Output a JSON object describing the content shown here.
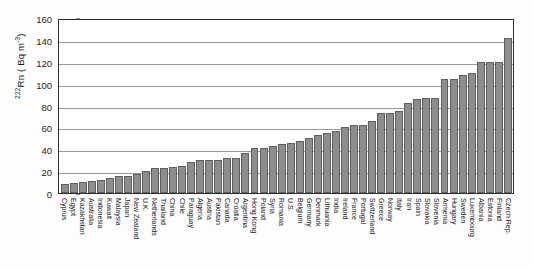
{
  "chart_data": {
    "type": "bar",
    "title": "",
    "xlabel": "",
    "ylabel": "222Rn ( Bq m-3)",
    "ylabel_parts": {
      "sup_pre": "222",
      "base": "Rn ( Bq m",
      "sup_post": "-3",
      "tail": ")"
    },
    "ylim": [
      0,
      160
    ],
    "yticks": [
      0,
      20,
      40,
      60,
      80,
      100,
      120,
      140,
      160
    ],
    "ytick_labels": [
      "0",
      "20",
      "40",
      "60",
      "80",
      "100",
      "120",
      "140",
      "160"
    ],
    "grid": true,
    "grid_axis": "y",
    "legend": "none",
    "bar_color": "#8d8d8d",
    "bar_edge_color": "#5e5e5e",
    "axis_color": "#2e2e2e",
    "grid_color": "#9a9a9a",
    "categories": [
      "Cyprus",
      "Egypt",
      "Kazakhstan",
      "Australia",
      "Indonesia",
      "Kuwait",
      "Malaysia",
      "Japan",
      "New Zealand",
      "U.K.",
      "Netherlands",
      "Thailand",
      "China",
      "Chile",
      "Paraguay",
      "Algeria",
      "Austria",
      "Pakistan",
      "Canada",
      "Croatia",
      "Argentina",
      "Hong Kong",
      "Poland",
      "Syria",
      "Romania",
      "U.S.",
      "Belgium",
      "Germany",
      "Denmark",
      "Lithuania",
      "India",
      "Ireland",
      "France",
      "Portugal",
      "Switzerland",
      "Greece",
      "Norway",
      "Italy",
      "Iran",
      "Spain",
      "Slovakia",
      "Slovenia",
      "Armenia",
      "Hungary",
      "Sweden",
      "Luxembourg",
      "Albania",
      "Estonia",
      "Finland",
      "Czech Rep."
    ],
    "values": [
      8,
      9,
      10,
      11,
      12,
      14,
      16,
      16,
      17,
      20,
      23,
      23,
      24,
      25,
      28,
      30,
      30,
      30,
      32,
      32,
      37,
      41,
      41,
      43,
      45,
      46,
      48,
      50,
      53,
      55,
      57,
      60,
      62,
      62,
      66,
      73,
      73,
      75,
      82,
      86,
      87,
      87,
      104,
      104,
      108,
      110,
      120,
      120,
      120,
      142
    ],
    "value_unit": "Bq m-3"
  }
}
